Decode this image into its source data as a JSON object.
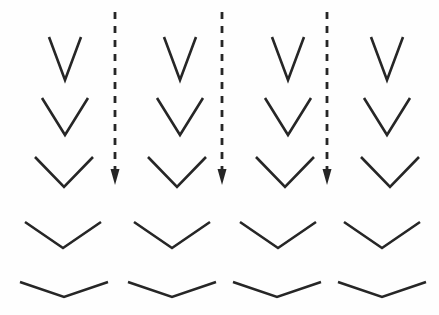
{
  "figure": {
    "width": 439,
    "height": 315,
    "background_color": "#fefefe",
    "stroke_color": "#262626"
  },
  "chart_data": {
    "type": "diagram",
    "xlabel": "",
    "ylabel": "",
    "grid": false,
    "legend_position": "none",
    "columns": 4,
    "rows": 5,
    "column_centers": [
      65,
      180,
      293,
      387
    ],
    "row_labels": [
      "row-1",
      "row-2",
      "row-3",
      "row-4",
      "row-5"
    ],
    "row_apex_y": [
      80,
      135,
      187,
      248,
      297
    ],
    "series": [
      {
        "name": "chevron-half-width-px",
        "values": [
          16,
          23,
          29,
          38,
          44
        ]
      },
      {
        "name": "chevron-depth-px",
        "values": [
          43,
          37,
          30,
          26,
          15
        ]
      },
      {
        "name": "chevron-opening-angle-deg",
        "values": [
          41,
          63,
          88,
          111,
          142
        ]
      }
    ],
    "annotations": [
      {
        "label": "arrow-1",
        "x": 115,
        "y_start": 12,
        "y_end": 185
      },
      {
        "label": "arrow-2",
        "x": 222,
        "y_start": 12,
        "y_end": 185
      },
      {
        "label": "arrow-3",
        "x": 327,
        "y_start": 12,
        "y_end": 185
      }
    ]
  },
  "chevrons": [
    {
      "id": "chevron-r1c1",
      "row": 1,
      "col": 1,
      "cx": 65,
      "apex_y": 80,
      "half_width": 16,
      "depth": 43,
      "stroke_width": 2.6
    },
    {
      "id": "chevron-r1c2",
      "row": 1,
      "col": 2,
      "cx": 180,
      "apex_y": 80,
      "half_width": 16,
      "depth": 43,
      "stroke_width": 2.6
    },
    {
      "id": "chevron-r1c3",
      "row": 1,
      "col": 3,
      "cx": 288,
      "apex_y": 80,
      "half_width": 16,
      "depth": 43,
      "stroke_width": 2.6
    },
    {
      "id": "chevron-r1c4",
      "row": 1,
      "col": 4,
      "cx": 387,
      "apex_y": 80,
      "half_width": 16,
      "depth": 43,
      "stroke_width": 2.6
    },
    {
      "id": "chevron-r2c1",
      "row": 2,
      "col": 1,
      "cx": 65,
      "apex_y": 135,
      "half_width": 23,
      "depth": 37,
      "stroke_width": 2.6
    },
    {
      "id": "chevron-r2c2",
      "row": 2,
      "col": 2,
      "cx": 180,
      "apex_y": 135,
      "half_width": 23,
      "depth": 37,
      "stroke_width": 2.6
    },
    {
      "id": "chevron-r2c3",
      "row": 2,
      "col": 3,
      "cx": 288,
      "apex_y": 135,
      "half_width": 23,
      "depth": 37,
      "stroke_width": 2.6
    },
    {
      "id": "chevron-r2c4",
      "row": 2,
      "col": 4,
      "cx": 387,
      "apex_y": 135,
      "half_width": 23,
      "depth": 37,
      "stroke_width": 2.6
    },
    {
      "id": "chevron-r3c1",
      "row": 3,
      "col": 1,
      "cx": 64,
      "apex_y": 187,
      "half_width": 29,
      "depth": 30,
      "stroke_width": 2.6
    },
    {
      "id": "chevron-r3c2",
      "row": 3,
      "col": 2,
      "cx": 177,
      "apex_y": 187,
      "half_width": 29,
      "depth": 30,
      "stroke_width": 2.6
    },
    {
      "id": "chevron-r3c3",
      "row": 3,
      "col": 3,
      "cx": 285,
      "apex_y": 187,
      "half_width": 29,
      "depth": 30,
      "stroke_width": 2.6
    },
    {
      "id": "chevron-r3c4",
      "row": 3,
      "col": 4,
      "cx": 390,
      "apex_y": 187,
      "half_width": 29,
      "depth": 30,
      "stroke_width": 2.6
    },
    {
      "id": "chevron-r4c1",
      "row": 4,
      "col": 1,
      "cx": 63,
      "apex_y": 248,
      "half_width": 38,
      "depth": 26,
      "stroke_width": 2.6
    },
    {
      "id": "chevron-r4c2",
      "row": 4,
      "col": 2,
      "cx": 172,
      "apex_y": 248,
      "half_width": 38,
      "depth": 26,
      "stroke_width": 2.6
    },
    {
      "id": "chevron-r4c3",
      "row": 4,
      "col": 3,
      "cx": 278,
      "apex_y": 248,
      "half_width": 38,
      "depth": 26,
      "stroke_width": 2.6
    },
    {
      "id": "chevron-r4c4",
      "row": 4,
      "col": 4,
      "cx": 382,
      "apex_y": 248,
      "half_width": 38,
      "depth": 26,
      "stroke_width": 2.6
    },
    {
      "id": "chevron-r5c1",
      "row": 5,
      "col": 1,
      "cx": 64,
      "apex_y": 297,
      "half_width": 44,
      "depth": 15,
      "stroke_width": 2.6
    },
    {
      "id": "chevron-r5c2",
      "row": 5,
      "col": 2,
      "cx": 172,
      "apex_y": 297,
      "half_width": 44,
      "depth": 15,
      "stroke_width": 2.6
    },
    {
      "id": "chevron-r5c3",
      "row": 5,
      "col": 3,
      "cx": 277,
      "apex_y": 297,
      "half_width": 44,
      "depth": 15,
      "stroke_width": 2.6
    },
    {
      "id": "chevron-r5c4",
      "row": 5,
      "col": 4,
      "cx": 382,
      "apex_y": 297,
      "half_width": 44,
      "depth": 15,
      "stroke_width": 2.6
    }
  ],
  "arrows": [
    {
      "id": "dashed-arrow-1",
      "x": 115,
      "y_start": 12,
      "y_end": 185,
      "stroke_width": 2.8,
      "dash_pattern": "7 7",
      "head_width": 9,
      "head_length": 16
    },
    {
      "id": "dashed-arrow-2",
      "x": 222,
      "y_start": 12,
      "y_end": 185,
      "stroke_width": 2.8,
      "dash_pattern": "7 7",
      "head_width": 9,
      "head_length": 16
    },
    {
      "id": "dashed-arrow-3",
      "x": 327,
      "y_start": 12,
      "y_end": 185,
      "stroke_width": 2.8,
      "dash_pattern": "7 7",
      "head_width": 9,
      "head_length": 16
    }
  ]
}
